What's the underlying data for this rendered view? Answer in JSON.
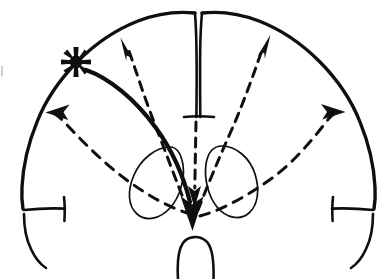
{
  "figure": {
    "caption": "Hand-drawn axial (transverse) outline of the cerebrum showing a focal lesion marked by an asterisk in the left hemisphere, with one solid arrow and four dashed arrows indicating directions of spread.",
    "background_color": "#ffffff",
    "ink_color": "#100f0f",
    "width": 382,
    "height": 279
  },
  "structures": [
    {
      "id": "brain-outline",
      "label": "Cerebral hemispheres outline",
      "interactable": false
    },
    {
      "id": "interhemispheric-fissure",
      "label": "Interhemispheric fissure (midline)",
      "interactable": false
    },
    {
      "id": "left-sylvian-notch",
      "label": "Left temporal notch",
      "interactable": false
    },
    {
      "id": "right-sylvian-notch",
      "label": "Right temporal notch",
      "interactable": false
    },
    {
      "id": "left-deep-nucleus",
      "label": "Left deep nucleus oval",
      "interactable": false
    },
    {
      "id": "right-deep-nucleus",
      "label": "Right deep nucleus oval",
      "interactable": false
    },
    {
      "id": "brainstem",
      "label": "Brainstem outline",
      "interactable": false
    }
  ],
  "markers": [
    {
      "id": "focus-asterisk",
      "glyph": "asterisk",
      "label": "Seizure focus",
      "x": 76,
      "y": 62
    }
  ],
  "arrows": [
    {
      "id": "arrow-solid-to-center",
      "style": "solid",
      "label": "Primary spread to midline",
      "from": [
        86,
        70
      ],
      "to": [
        191,
        224
      ],
      "tip": [
        191,
        224
      ]
    },
    {
      "id": "arrow-dashed-upper-left",
      "style": "dashed",
      "label": "Spread toward left frontal convexity",
      "from": [
        186,
        212
      ],
      "to": [
        121,
        38
      ],
      "tip": [
        121,
        38
      ]
    },
    {
      "id": "arrow-dashed-left-lateral",
      "style": "dashed",
      "label": "Spread toward left lateral cortex",
      "from": [
        190,
        216
      ],
      "to": [
        47,
        113
      ],
      "tip": [
        47,
        113
      ]
    },
    {
      "id": "arrow-dashed-upper-right",
      "style": "dashed",
      "label": "Spread toward right frontal convexity",
      "from": [
        196,
        212
      ],
      "to": [
        270,
        35
      ],
      "tip": [
        270,
        35
      ]
    },
    {
      "id": "arrow-dashed-right-lateral",
      "style": "dashed",
      "label": "Spread toward right lateral cortex",
      "from": [
        198,
        214
      ],
      "to": [
        342,
        114
      ],
      "tip": [
        342,
        114
      ]
    },
    {
      "id": "arrow-dashed-center-down",
      "style": "dashed",
      "label": "Spread down the midline",
      "from": [
        196,
        120
      ],
      "to": [
        194,
        206
      ],
      "tip": [
        194,
        206
      ]
    }
  ],
  "chart_data": {
    "type": "diagram",
    "nodes": [
      {
        "name": "Seizure focus (asterisk)",
        "x": 76,
        "y": 62
      },
      {
        "name": "Midline convergence point",
        "x": 193,
        "y": 225
      }
    ],
    "edges": [
      {
        "from": "Seizure focus",
        "to": "Midline convergence point",
        "style": "solid"
      },
      {
        "from": "Midline convergence point",
        "to": "Left frontal convexity",
        "style": "dashed"
      },
      {
        "from": "Midline convergence point",
        "to": "Left lateral cortex",
        "style": "dashed"
      },
      {
        "from": "Midline convergence point",
        "to": "Right frontal convexity",
        "style": "dashed"
      },
      {
        "from": "Midline convergence point",
        "to": "Right lateral cortex",
        "style": "dashed"
      },
      {
        "from": "Midline top",
        "to": "Midline convergence point",
        "style": "dashed"
      }
    ]
  }
}
